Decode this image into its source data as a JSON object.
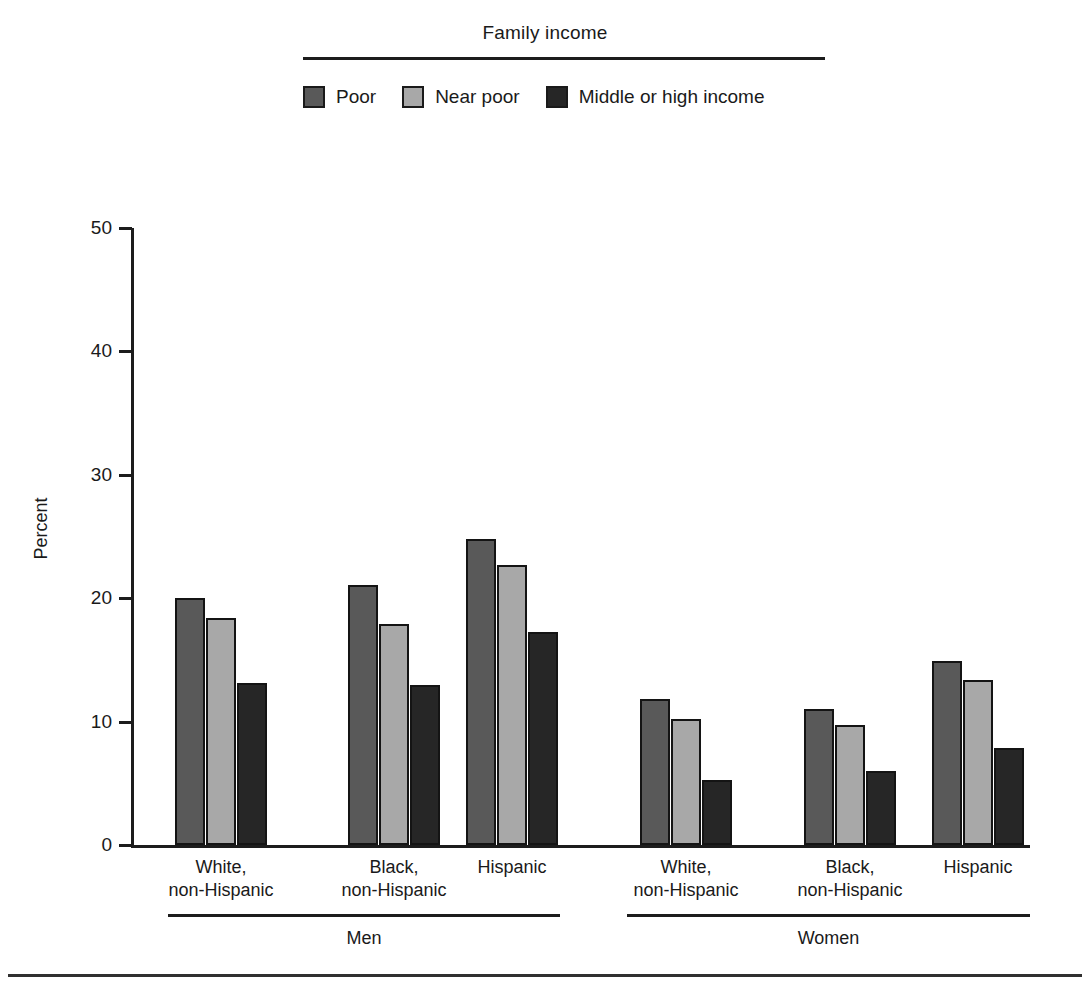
{
  "legend": {
    "title": "Family income",
    "entries": [
      {
        "label": "Poor",
        "color": "#595959"
      },
      {
        "label": "Near poor",
        "color": "#a8a8a8"
      },
      {
        "label": "Middle or high income",
        "color": "#262626"
      }
    ]
  },
  "axes": {
    "ylabel": "Percent",
    "yticks": [
      "0",
      "10",
      "20",
      "30",
      "40",
      "50"
    ]
  },
  "sections": [
    {
      "label": "Men"
    },
    {
      "label": "Women"
    }
  ],
  "categories": [
    {
      "line1": "White,",
      "line2": "non-Hispanic"
    },
    {
      "line1": "Black,",
      "line2": "non-Hispanic"
    },
    {
      "line1": "Hispanic",
      "line2": ""
    },
    {
      "line1": "White,",
      "line2": "non-Hispanic"
    },
    {
      "line1": "Black,",
      "line2": "non-Hispanic"
    },
    {
      "line1": "Hispanic",
      "line2": ""
    }
  ],
  "chart_data": {
    "type": "bar",
    "title": "",
    "xlabel": "",
    "ylabel": "Percent",
    "ylim": [
      0,
      50
    ],
    "ytick_step": 10,
    "grid": false,
    "legend_title": "Family income",
    "legend_position": "top-center",
    "groups": [
      "Men - White, non-Hispanic",
      "Men - Black, non-Hispanic",
      "Men - Hispanic",
      "Women - White, non-Hispanic",
      "Women - Black, non-Hispanic",
      "Women - Hispanic"
    ],
    "categories": [
      "White, non-Hispanic",
      "Black, non-Hispanic",
      "Hispanic",
      "White, non-Hispanic",
      "Black, non-Hispanic",
      "Hispanic"
    ],
    "sections": [
      "Men",
      "Men",
      "Men",
      "Women",
      "Women",
      "Women"
    ],
    "series": [
      {
        "name": "Poor",
        "color": "#595959",
        "values": [
          20.0,
          21.1,
          24.8,
          11.8,
          11.0,
          14.9
        ]
      },
      {
        "name": "Near poor",
        "color": "#a8a8a8",
        "values": [
          18.4,
          17.9,
          22.7,
          10.2,
          9.7,
          13.4
        ]
      },
      {
        "name": "Middle or high income",
        "color": "#262626",
        "values": [
          13.1,
          13.0,
          17.3,
          5.3,
          6.0,
          7.9
        ]
      }
    ]
  }
}
